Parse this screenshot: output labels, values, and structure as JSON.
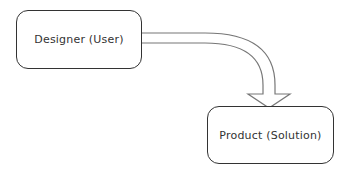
{
  "diagram": {
    "nodes": [
      {
        "id": "designer",
        "label": "Designer (User)"
      },
      {
        "id": "product",
        "label": "Product (Solution)"
      }
    ],
    "edges": [
      {
        "from": "designer",
        "to": "product",
        "style": "hollow-block-arrow",
        "color": "#666666"
      }
    ]
  }
}
